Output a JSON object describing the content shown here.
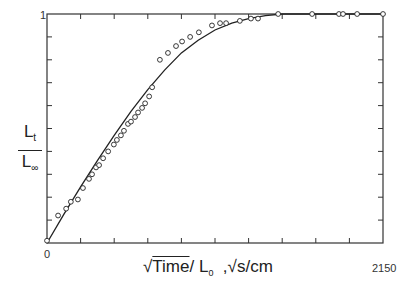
{
  "chart_data": {
    "type": "scatter",
    "title": "",
    "xlabel": "√Time / L₀ , √s/cm",
    "ylabel": "L_t / L_∞",
    "x_tick_labels": [
      "0"
    ],
    "y_tick_labels": [
      "0",
      "1"
    ],
    "xlim": [
      0,
      10
    ],
    "ylim": [
      0,
      1
    ],
    "x_divisions": 10,
    "y_divisions": 10,
    "grid": false,
    "legend": null,
    "figure_number": "2150",
    "series": [
      {
        "name": "measured",
        "marker": "open-circle",
        "x": [
          0.0,
          0.33,
          0.57,
          0.71,
          0.92,
          1.07,
          1.25,
          1.34,
          1.46,
          1.55,
          1.67,
          1.82,
          1.99,
          2.08,
          2.2,
          2.29,
          2.41,
          2.5,
          2.62,
          2.71,
          2.83,
          2.92,
          3.04,
          3.13,
          3.36,
          3.6,
          3.84,
          4.02,
          4.26,
          4.52,
          4.91,
          5.15,
          5.33,
          5.74,
          6.07,
          6.28,
          6.88,
          7.89,
          8.69,
          8.81,
          9.23,
          10.0
        ],
        "y": [
          0.01,
          0.12,
          0.15,
          0.18,
          0.19,
          0.24,
          0.28,
          0.3,
          0.33,
          0.34,
          0.37,
          0.4,
          0.43,
          0.45,
          0.47,
          0.49,
          0.52,
          0.53,
          0.55,
          0.57,
          0.59,
          0.61,
          0.64,
          0.68,
          0.8,
          0.83,
          0.86,
          0.88,
          0.9,
          0.92,
          0.95,
          0.96,
          0.96,
          0.97,
          0.98,
          0.98,
          1.0,
          1.0,
          1.0,
          1.0,
          1.0,
          1.0
        ]
      },
      {
        "name": "fitted curve",
        "marker": "line",
        "x": [
          0,
          0.5,
          1.0,
          1.5,
          2.0,
          2.5,
          3.0,
          3.5,
          4.0,
          4.5,
          5.0,
          5.5,
          6.0,
          6.5,
          7.0,
          8.0,
          9.0,
          10.0
        ],
        "y": [
          0,
          0.125,
          0.245,
          0.36,
          0.47,
          0.575,
          0.67,
          0.755,
          0.83,
          0.885,
          0.93,
          0.96,
          0.98,
          0.993,
          1.0,
          1.0,
          1.0,
          1.0
        ]
      }
    ]
  },
  "labels": {
    "y_num": "L",
    "y_num_sub": "t",
    "y_den": "L",
    "y_den_sub": "∞",
    "x_sqrt": "√",
    "x_time": "Time",
    "x_rest": "/ L",
    "x_sub": "0",
    "x_units": "  ,√s/cm",
    "y_top": "1",
    "origin": "0",
    "figure_number": "2150"
  }
}
